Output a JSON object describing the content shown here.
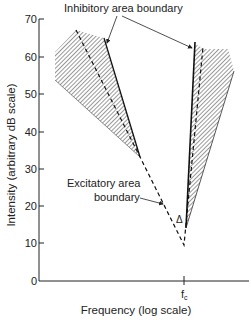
{
  "figure": {
    "y_axis": {
      "label": "Intensity (arbitrary dB scale)",
      "ticks": [
        "0",
        "10",
        "20",
        "30",
        "40",
        "50",
        "60",
        "70"
      ]
    },
    "x_axis": {
      "label": "Frequency (log scale)",
      "tick_label": "f",
      "tick_subscript": "c"
    },
    "annotations": {
      "inhibitory": "Inhibitory area boundary",
      "excitatory_line1": "Excitatory area",
      "excitatory_line2": "boundary",
      "delta": "Δ"
    },
    "colors": {
      "ink": "#222222",
      "background": "#ffffff"
    }
  }
}
